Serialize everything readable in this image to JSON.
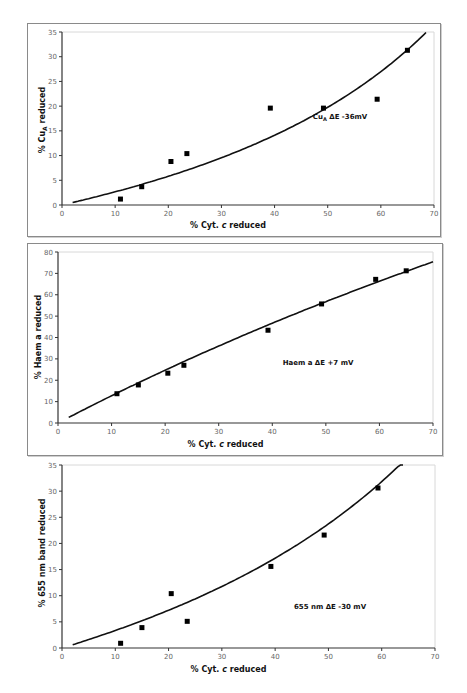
{
  "chart_data": [
    {
      "type": "scatter",
      "title": "",
      "xlabel": "% Cyt. c reduced",
      "ylabel": "% CuA reduced",
      "annotation": "CuA ΔE -36mV",
      "xlim": [
        0,
        70
      ],
      "ylim": [
        0,
        35
      ],
      "xticks": [
        0,
        10,
        20,
        30,
        40,
        50,
        60,
        70
      ],
      "yticks": [
        0,
        5,
        10,
        15,
        20,
        25,
        30,
        35
      ],
      "grid": false,
      "legend": null,
      "series": [
        {
          "name": "data",
          "x": [
            11,
            15,
            20.5,
            23.5,
            39.2,
            49.2,
            59.3,
            65
          ],
          "y": [
            1.2,
            3.7,
            8.8,
            10.4,
            19.6,
            19.6,
            21.4,
            31.3
          ]
        },
        {
          "name": "fit (ΔE -36 mV)",
          "type": "line",
          "x_range": [
            2,
            68.7
          ]
        }
      ],
      "fit_dE_mV": -36
    },
    {
      "type": "scatter",
      "title": "",
      "xlabel": "% Cyt. c reduced",
      "ylabel": "% Haem a reduced",
      "annotation": "Haem a ΔE +7 mV",
      "xlim": [
        0,
        70
      ],
      "ylim": [
        0,
        80
      ],
      "xticks": [
        0,
        10,
        20,
        30,
        40,
        50,
        60,
        70
      ],
      "yticks": [
        0,
        10,
        20,
        30,
        40,
        50,
        60,
        70,
        80
      ],
      "grid": false,
      "legend": null,
      "series": [
        {
          "name": "data",
          "x": [
            11,
            15,
            20.5,
            23.5,
            39.2,
            49.2,
            59.3,
            65
          ],
          "y": [
            13.7,
            17.8,
            23.3,
            27.0,
            43.4,
            55.7,
            67.2,
            71.2
          ]
        },
        {
          "name": "fit (ΔE +7 mV)",
          "type": "line",
          "x_range": [
            2,
            70
          ]
        }
      ],
      "fit_dE_mV": 7
    },
    {
      "type": "scatter",
      "title": "",
      "xlabel": "% Cyt. c reduced",
      "ylabel": "% 655 nm band reduced",
      "annotation": "655 nm ΔE -30 mV",
      "xlim": [
        0,
        70
      ],
      "ylim": [
        0,
        35
      ],
      "xticks": [
        0,
        10,
        20,
        30,
        40,
        50,
        60,
        70
      ],
      "yticks": [
        0,
        5,
        10,
        15,
        20,
        25,
        30,
        35
      ],
      "grid": false,
      "legend": null,
      "series": [
        {
          "name": "data",
          "x": [
            11,
            15,
            20.5,
            23.5,
            39.2,
            49.2,
            59.3
          ],
          "y": [
            0.9,
            3.9,
            10.4,
            5.1,
            15.6,
            21.6,
            30.6
          ]
        },
        {
          "name": "fit (ΔE -30 mV)",
          "type": "line",
          "x_range": [
            2,
            64.2
          ]
        }
      ],
      "fit_dE_mV": -30
    }
  ],
  "charts": [
    {
      "ylabel": "% Cuₐ reduced",
      "ylabel_main": "% Cu",
      "ylabel_sub": "A",
      "ylabel_rest": " reduced",
      "xlabel": "% Cyt. c reduced",
      "annot_main": "Cu",
      "annot_sub": "A",
      "annot_rest": " ΔE -36mV"
    },
    {
      "ylabel": "% Haem a reduced",
      "xlabel": "% Cyt. c reduced",
      "annot": "Haem a ΔE +7 mV"
    },
    {
      "ylabel": "% 655 nm band reduced",
      "xlabel": "% Cyt. c reduced",
      "annot": "655 nm ΔE -30 mV"
    }
  ]
}
